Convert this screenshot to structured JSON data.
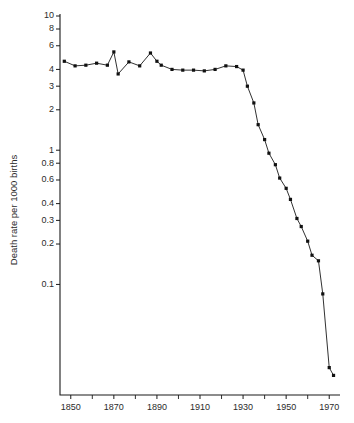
{
  "chart_data": {
    "type": "line",
    "title": "",
    "subtitle": "",
    "xlabel": "",
    "ylabel": "Death rate per 1000 births",
    "xlim": [
      1845,
      1975
    ],
    "ylim": [
      0.015,
      10
    ],
    "yscale": "log",
    "xscale": "linear",
    "grid": false,
    "legend": null,
    "x_ticks": [
      1850,
      1870,
      1890,
      1910,
      1930,
      1950,
      1970
    ],
    "x_tick_labels": [
      "1850",
      "1870",
      "1890",
      "1910",
      "1930",
      "1950",
      "1970"
    ],
    "x_minor_ticks": [
      1860,
      1880,
      1900,
      1920,
      1940,
      1960
    ],
    "y_ticks": [
      10,
      8,
      6,
      4,
      3,
      2,
      1,
      0.8,
      0.6,
      0.4,
      0.3,
      0.2,
      0.1
    ],
    "y_tick_labels": [
      "10",
      "8",
      "6",
      "4",
      "3",
      "2",
      "1",
      "0.8",
      "0.6",
      "0.4",
      "0.3",
      "0.2",
      "0.1"
    ],
    "marker": "filled-square",
    "line_color": "#1a1a1a",
    "marker_color": "#111111",
    "series": [
      {
        "name": "Death rate per 1000 births",
        "x": [
          1847,
          1852,
          1857,
          1862,
          1867,
          1870,
          1872,
          1877,
          1882,
          1887,
          1890,
          1892,
          1897,
          1902,
          1907,
          1912,
          1917,
          1922,
          1927,
          1930,
          1932,
          1935,
          1937,
          1940,
          1942,
          1945,
          1947,
          1950,
          1952,
          1955,
          1957,
          1960,
          1962,
          1965,
          1967,
          1970,
          1972
        ],
        "y": [
          4.6,
          4.25,
          4.3,
          4.45,
          4.3,
          5.4,
          3.7,
          4.55,
          4.25,
          5.3,
          4.6,
          4.3,
          4.0,
          3.95,
          3.95,
          3.9,
          4.0,
          4.25,
          4.2,
          3.95,
          3.0,
          2.25,
          1.55,
          1.2,
          0.95,
          0.78,
          0.62,
          0.52,
          0.43,
          0.31,
          0.27,
          0.21,
          0.165,
          0.15,
          0.085,
          0.024,
          0.021
        ]
      }
    ]
  },
  "axis": {
    "ylabel": "Death rate per 1000 births"
  }
}
